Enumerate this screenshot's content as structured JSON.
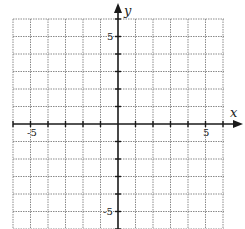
{
  "graph": {
    "x_axis_label": "x",
    "y_axis_label": "y",
    "x_range": [
      -6,
      6
    ],
    "y_range": [
      -6,
      6
    ],
    "grid_step": 1,
    "tick_labels": {
      "x_neg": "-5",
      "x_pos": "5",
      "y_pos": "5",
      "y_neg": "-5"
    },
    "colors": {
      "grid": "#8a8a8a",
      "axis": "#1a1a1a",
      "background": "#ffffff"
    }
  }
}
